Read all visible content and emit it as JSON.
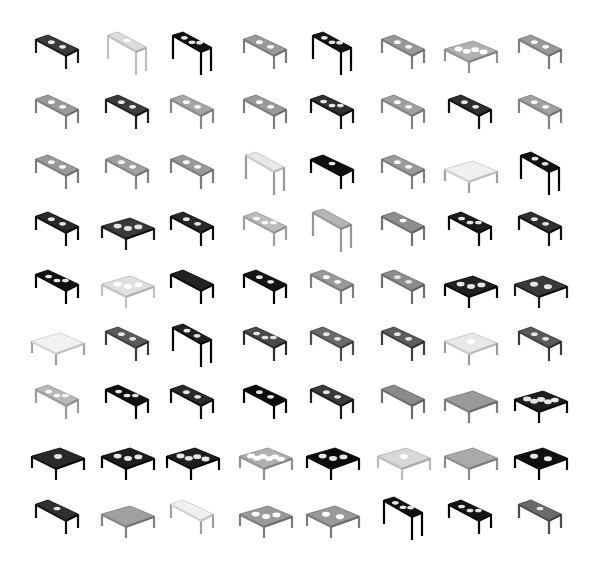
{
  "grid": {
    "rows": 9,
    "cols": 8,
    "col_centers": [
      57,
      127,
      192,
      265,
      332,
      403,
      470,
      540
    ],
    "row_centers": [
      55,
      115,
      175,
      232,
      290,
      347,
      405,
      462,
      520
    ],
    "background": "#ffffff"
  },
  "cells": [
    [
      "long:#3a3a3a:2",
      "tall:#dcdcdc:1",
      "tall:#111111:3",
      "long:#9a9a9a:2",
      "tall:#151515:3",
      "long:#999999:2",
      "wide:#b0b0b0:4",
      "long:#9a9a9a:2"
    ],
    [
      "long:#9a9a9a:2",
      "long:#3c3c3c:2",
      "long:#a5a5a5:2",
      "long:#9a9a9a:2",
      "long:#303030:3",
      "long:#a0a0a0:2",
      "long:#2e2e2e:2",
      "long:#a0a0a0:2"
    ],
    [
      "long:#9a9a9a:2",
      "long:#a0a0a0:2",
      "long:#999999:2",
      "tall:#e8e8e8:0",
      "long:#0e0e0e:1",
      "long:#9a9a9a:2",
      "wide:#f0f0f0:0",
      "tall:#121212:2"
    ],
    [
      "long:#2a2a2a:2",
      "wide:#3a3a3a:3",
      "long:#2a2a2a:2",
      "long:#bdbdbd:3",
      "tall:#b5b5b5:0",
      "long:#8e8e8e:1",
      "long:#1c1c1c:3",
      "long:#2f2f2f:2"
    ],
    [
      "long:#111111:3",
      "wide:#e0e0e0:3",
      "long:#222222:0",
      "long:#151515:2",
      "long:#9a9a9a:2",
      "long:#8c8c8c:2",
      "wide:#202020:3",
      "wide:#3a3a3a:2"
    ],
    [
      "wide:#f2f2f2:0",
      "long:#5a5a5a:2",
      "tall:#222222:2",
      "long:#4a4a4a:3",
      "long:#6a6a6a:2",
      "long:#5c5c5c:2",
      "wide:#e8e8e8:1",
      "long:#5a5a5a:2"
    ],
    [
      "long:#b8b8b8:3",
      "long:#0f0f0f:3",
      "long:#2a2a2a:2",
      "long:#0c0c0c:2",
      "long:#3a3a3a:2",
      "long:#8a8a8a:0",
      "wide:#9a9a9a:0",
      "wide:#1e1e1e:5"
    ],
    [
      "wide:#2a2a2a:1",
      "wide:#1e1e1e:3",
      "wide:#1e1e1e:4",
      "wide:#b0b0b0:6",
      "wide:#0a0a0a:3",
      "wide:#d8d8d8:1",
      "wide:#aaaaaa:0",
      "wide:#0f0f0f:2"
    ],
    [
      "long:#303030:1",
      "wide:#a0a0a0:0",
      "long:#f0f0f0:0",
      "wide:#9a9a9a:3",
      "wide:#999999:2",
      "tall:#101010:3",
      "long:#151515:3",
      "long:#6a6a6a:1"
    ]
  ]
}
